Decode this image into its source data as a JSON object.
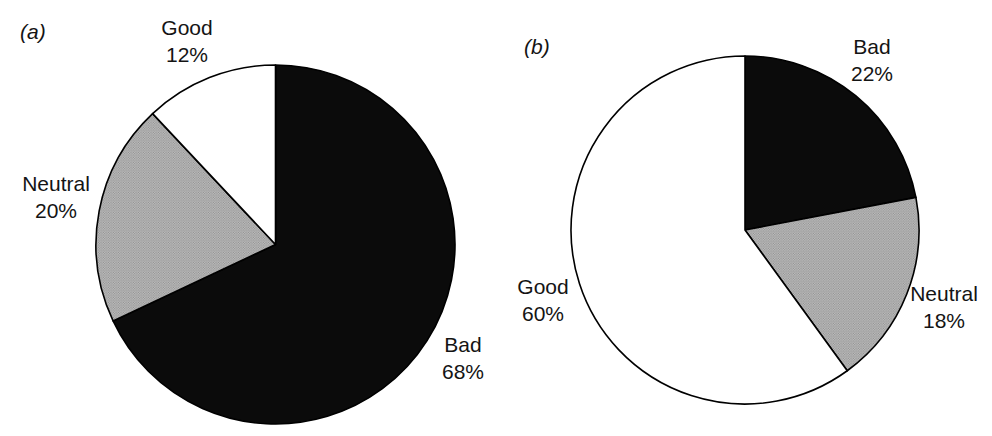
{
  "figure": {
    "background": "#ffffff",
    "text_color": "#141414",
    "outline_color": "#000000",
    "halftone_base_color": "#bdbdbd",
    "halftone_dot_color": "#8a8a8a"
  },
  "chart_data": [
    {
      "type": "pie",
      "panel_label": "(a)",
      "start_angle_deg": 0,
      "direction": "clockwise",
      "outline_color": "#000000",
      "slices": [
        {
          "label": "Bad",
          "value_pct": 68,
          "pct_label": "68%",
          "fill": "#0b0b0b",
          "texture": "solid"
        },
        {
          "label": "Neutral",
          "value_pct": 20,
          "pct_label": "20%",
          "fill": "#a8a8a8",
          "texture": "halftone-dots"
        },
        {
          "label": "Good",
          "value_pct": 12,
          "pct_label": "12%",
          "fill": "#ffffff",
          "texture": "solid"
        }
      ]
    },
    {
      "type": "pie",
      "panel_label": "(b)",
      "start_angle_deg": 0,
      "direction": "clockwise",
      "outline_color": "#000000",
      "slices": [
        {
          "label": "Bad",
          "value_pct": 22,
          "pct_label": "22%",
          "fill": "#0b0b0b",
          "texture": "solid"
        },
        {
          "label": "Neutral",
          "value_pct": 18,
          "pct_label": "18%",
          "fill": "#a8a8a8",
          "texture": "halftone-dots"
        },
        {
          "label": "Good",
          "value_pct": 60,
          "pct_label": "60%",
          "fill": "#ffffff",
          "texture": "solid"
        }
      ]
    }
  ]
}
